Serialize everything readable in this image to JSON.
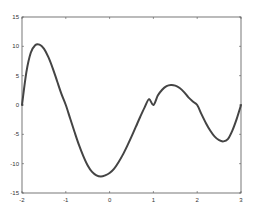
{
  "chart_data": {
    "type": "line",
    "title": "",
    "xlabel": "",
    "ylabel": "",
    "xlim": [
      -2,
      3
    ],
    "ylim": [
      -15,
      15
    ],
    "grid": false,
    "legend": null,
    "x_ticks": [
      "-2",
      "-1",
      "0",
      "1",
      "2",
      "3"
    ],
    "y_ticks": [
      "15",
      "10",
      "5",
      "0",
      "-5",
      "-10",
      "-15"
    ],
    "series": [
      {
        "name": "curve",
        "color": "#444444",
        "x": [
          -2.0,
          -1.9,
          -1.8,
          -1.7,
          -1.6,
          -1.5,
          -1.4,
          -1.3,
          -1.2,
          -1.1,
          -1.0,
          -0.9,
          -0.8,
          -0.7,
          -0.6,
          -0.5,
          -0.4,
          -0.3,
          -0.2,
          -0.1,
          0.0,
          0.1,
          0.2,
          0.3,
          0.4,
          0.5,
          0.6,
          0.7,
          0.8,
          0.9,
          1.0,
          1.1,
          1.2,
          1.3,
          1.4,
          1.5,
          1.6,
          1.7,
          1.8,
          1.9,
          2.0,
          2.1,
          2.2,
          2.3,
          2.4,
          2.5,
          2.6,
          2.7,
          2.8,
          2.9,
          3.0
        ],
        "y": [
          0.0,
          5.6,
          8.9,
          10.2,
          10.3,
          9.6,
          8.2,
          6.3,
          4.1,
          1.9,
          0.0,
          -2.3,
          -4.6,
          -6.8,
          -8.7,
          -10.3,
          -11.4,
          -12.0,
          -12.2,
          -12.0,
          -11.6,
          -10.9,
          -9.8,
          -8.5,
          -7.0,
          -5.4,
          -3.7,
          -2.0,
          -0.4,
          1.0,
          0.0,
          1.6,
          2.6,
          3.2,
          3.4,
          3.3,
          2.9,
          2.2,
          1.3,
          0.6,
          0.0,
          -1.6,
          -3.1,
          -4.4,
          -5.4,
          -6.0,
          -6.2,
          -5.8,
          -4.4,
          -2.4,
          0.0
        ]
      }
    ]
  }
}
